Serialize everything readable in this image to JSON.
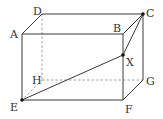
{
  "diagram": {
    "colors": {
      "stroke": "#3a3a3a",
      "hidden": "#8a8a8a",
      "point": "#111111",
      "background": "#ffffff"
    },
    "vertices": {
      "A": {
        "label": "A",
        "x": 22,
        "y": 34
      },
      "B": {
        "label": "B",
        "x": 123,
        "y": 34
      },
      "C": {
        "label": "C",
        "x": 143,
        "y": 14
      },
      "D": {
        "label": "D",
        "x": 42,
        "y": 14
      },
      "E": {
        "label": "E",
        "x": 22,
        "y": 100
      },
      "F": {
        "label": "F",
        "x": 123,
        "y": 100
      },
      "G": {
        "label": "G",
        "x": 143,
        "y": 80
      },
      "H": {
        "label": "H",
        "x": 42,
        "y": 80
      },
      "X": {
        "label": "X",
        "x": 123,
        "y": 55
      }
    },
    "edges_visible": [
      "AB",
      "BC",
      "CD",
      "DA",
      "AE",
      "BF",
      "CG",
      "EF",
      "FG"
    ],
    "edges_hidden": [
      "DH",
      "HE",
      "HG"
    ],
    "segments": [
      "EX",
      "XC",
      "BC"
    ],
    "marked_points": [
      "E",
      "X",
      "C"
    ]
  }
}
